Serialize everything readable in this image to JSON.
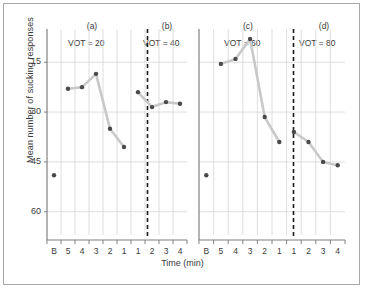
{
  "chart_data": {
    "type": "line",
    "title": "",
    "xlabel": "Time (min)",
    "ylabel": "Mean number of sucking responses",
    "ylim": [
      8,
      70
    ],
    "yticks": [
      15,
      30,
      45,
      60
    ],
    "grid": true,
    "legend": false,
    "panels": [
      {
        "group": "left",
        "letter": "(a)",
        "condition_label": "VOT = 20",
        "x_ticks": [
          "B",
          "5",
          "4",
          "3",
          "2",
          "1"
        ],
        "points": [
          {
            "x": "B",
            "y": 26,
            "isolated": true
          },
          {
            "x": "5",
            "y": 52
          },
          {
            "x": "4",
            "y": 52.5
          },
          {
            "x": "3",
            "y": 56.5
          },
          {
            "x": "2",
            "y": 40
          },
          {
            "x": "1",
            "y": 34.5
          }
        ]
      },
      {
        "group": "left",
        "letter": "(b)",
        "condition_label": "VOT = 40",
        "x_ticks": [
          "1",
          "2",
          "3",
          "4"
        ],
        "points": [
          {
            "x": "1",
            "y": 51
          },
          {
            "x": "2",
            "y": 46.5
          },
          {
            "x": "3",
            "y": 48
          },
          {
            "x": "4",
            "y": 47.5
          }
        ]
      },
      {
        "group": "right",
        "letter": "(c)",
        "condition_label": "VOT = 60",
        "x_ticks": [
          "B",
          "5",
          "4",
          "3",
          "2",
          "1"
        ],
        "points": [
          {
            "x": "B",
            "y": 26,
            "isolated": true
          },
          {
            "x": "5",
            "y": 59.5
          },
          {
            "x": "4",
            "y": 61
          },
          {
            "x": "3",
            "y": 67
          },
          {
            "x": "2",
            "y": 43.5
          },
          {
            "x": "1",
            "y": 36
          }
        ]
      },
      {
        "group": "right",
        "letter": "(d)",
        "condition_label": "VOT = 80",
        "x_ticks": [
          "1",
          "2",
          "3",
          "4"
        ],
        "points": [
          {
            "x": "1",
            "y": 39
          },
          {
            "x": "2",
            "y": 36
          },
          {
            "x": "3",
            "y": 30
          },
          {
            "x": "4",
            "y": 29
          }
        ]
      }
    ],
    "colors": {
      "line": "#c9c9c9",
      "marker": "#4a4a4a",
      "grid": "#d6d6d6",
      "axis": "#808080",
      "divider": "#1a1a1a",
      "text": "#3a3a3a",
      "frame": "#a8a8a8"
    }
  },
  "axes": {
    "y_title": "Mean number of sucking responses",
    "x_title": "Time (min)",
    "y_tick_labels": [
      "60",
      "45",
      "30",
      "15"
    ],
    "left_x_tick_labels": [
      "B",
      "5",
      "4",
      "3",
      "2",
      "1",
      "1",
      "2",
      "3",
      "4"
    ],
    "right_x_tick_labels": [
      "B",
      "5",
      "4",
      "3",
      "2",
      "1",
      "1",
      "2",
      "3",
      "4"
    ]
  },
  "annotations": {
    "letter_a": "(a)",
    "letter_b": "(b)",
    "letter_c": "(c)",
    "letter_d": "(d)",
    "vot_a": "VOT = 20",
    "vot_b": "VOT = 40",
    "vot_c": "VOT = 60",
    "vot_d": "VOT = 80"
  }
}
